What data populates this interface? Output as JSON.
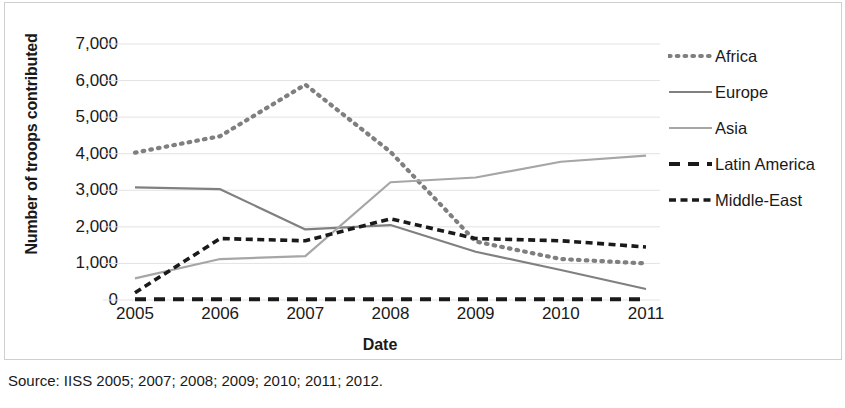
{
  "chart_data": {
    "type": "line",
    "title": "",
    "xlabel": "Date",
    "ylabel": "Number of troops contributed",
    "x": [
      2005,
      2006,
      2007,
      2008,
      2009,
      2010,
      2011
    ],
    "xtick_labels": [
      "2005",
      "2006",
      "2007",
      "2008",
      "2009",
      "2010",
      "2011"
    ],
    "ytick_labels": [
      "0",
      "1,000",
      "2,000",
      "3,000",
      "4,000",
      "5,000",
      "6,000",
      "7,000"
    ],
    "ytick_values": [
      0,
      1000,
      2000,
      3000,
      4000,
      5000,
      6000,
      7000
    ],
    "ylim": [
      0,
      7000
    ],
    "xlim": [
      2005,
      2011
    ],
    "grid": true,
    "legend_position": "right",
    "series": [
      {
        "name": "Africa",
        "style": "dotted",
        "color": "#7f7f7f",
        "values": [
          4030,
          4480,
          5890,
          4050,
          1600,
          1120,
          1000
        ]
      },
      {
        "name": "Europe",
        "style": "solid",
        "color": "#808080",
        "values": [
          3080,
          3030,
          1930,
          2050,
          1320,
          820,
          300
        ]
      },
      {
        "name": "Asia",
        "style": "solid",
        "color": "#a6a6a6",
        "values": [
          590,
          1120,
          1200,
          3220,
          3350,
          3780,
          3950
        ]
      },
      {
        "name": "Latin America",
        "style": "dashed",
        "color": "#1a1a1a",
        "values": [
          20,
          20,
          20,
          20,
          20,
          20,
          20
        ]
      },
      {
        "name": "Middle-East",
        "style": "dashed-fine",
        "color": "#1a1a1a",
        "values": [
          200,
          1680,
          1620,
          2220,
          1680,
          1620,
          1450
        ]
      }
    ]
  },
  "source": {
    "text": "Source: IISS 2005; 2007; 2008; 2009; 2010; 2011; 2012."
  },
  "legend": {
    "items": [
      {
        "label": "Africa"
      },
      {
        "label": "Europe"
      },
      {
        "label": "Asia"
      },
      {
        "label": "Latin America"
      },
      {
        "label": "Middle-East"
      }
    ]
  }
}
